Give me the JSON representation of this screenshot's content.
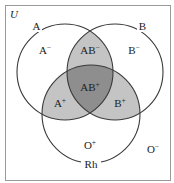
{
  "diagram": {
    "type": "venn",
    "universe_label": "U",
    "sets": [
      {
        "name": "A",
        "label": "A",
        "cx": 65,
        "cy": 72,
        "r": 48
      },
      {
        "name": "B",
        "label": "B",
        "cx": 115,
        "cy": 72,
        "r": 48
      },
      {
        "name": "Rh",
        "label": "Rh",
        "cx": 91,
        "cy": 114,
        "r": 49
      }
    ],
    "regions": {
      "a_neg": {
        "base": "A",
        "sup": "−"
      },
      "b_neg": {
        "base": "B",
        "sup": "−"
      },
      "ab_neg": {
        "base": "AB",
        "sup": "−"
      },
      "ab_pos": {
        "base": "AB",
        "sup": "+"
      },
      "a_pos": {
        "base": "A",
        "sup": "+"
      },
      "b_pos": {
        "base": "B",
        "sup": "+"
      },
      "o_pos": {
        "base": "O",
        "sup": "+"
      },
      "o_neg": {
        "base": "O",
        "sup": "−"
      }
    },
    "colors": {
      "background": "#ffffff",
      "outline": "#3a3a3a",
      "pair_fill": "#c4c4c4",
      "triple_fill": "#8e8e8e",
      "border": "#9a9a9a"
    }
  }
}
